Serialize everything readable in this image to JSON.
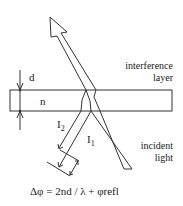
{
  "diagram": {
    "labels": {
      "thickness": "d",
      "refractive_index": "n",
      "layer": [
        "interference",
        "layer"
      ],
      "incident": [
        "incident",
        "light"
      ],
      "ray1": "I",
      "ray1_sub": "1",
      "ray2": "I",
      "ray2_sub": "2",
      "formula": "Δφ = 2nd / λ +  φrefl"
    },
    "colors": {
      "line": "#333333",
      "background": "#ffffff"
    }
  }
}
